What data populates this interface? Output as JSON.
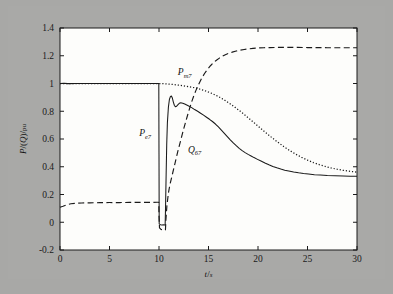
{
  "figure": {
    "background_color": "#a9a9a7",
    "plot_background_color": "#fdfdfb",
    "axis_color": "#1a1a1a"
  },
  "chart_data": {
    "type": "line",
    "title": "",
    "xlabel": "t/s",
    "ylabel": "P/(Q)/pu",
    "xlim": [
      0,
      30
    ],
    "ylim": [
      -0.2,
      1.4
    ],
    "xticks": [
      0,
      5,
      10,
      15,
      20,
      25,
      30
    ],
    "xtick_labels": [
      "0",
      "5",
      "10",
      "15",
      "20",
      "25",
      "30"
    ],
    "yticks": [
      -0.2,
      0,
      0.2,
      0.4,
      0.6,
      0.8,
      1,
      1.2,
      1.4
    ],
    "ytick_labels": [
      "-0.2",
      "0",
      "0.2",
      "0.4",
      "0.6",
      "0.8",
      "1",
      "1.2",
      "1.4"
    ],
    "grid": false,
    "legend_position": "inline-annotations",
    "annotations": [
      {
        "id": "Pe7",
        "text": "P",
        "sub": "e7",
        "x": 8.6,
        "y": 0.62
      },
      {
        "id": "Pm7",
        "text": "P",
        "sub": "m7",
        "x": 12.6,
        "y": 1.06
      },
      {
        "id": "Q67",
        "text": "Q",
        "sub": "67",
        "x": 13.6,
        "y": 0.5
      }
    ],
    "series": [
      {
        "name": "P_e7",
        "label": "Pe7",
        "style": "solid",
        "color": "#1a1a1a",
        "points": [
          [
            0.0,
            1.0
          ],
          [
            0.4,
            1.002
          ],
          [
            0.8,
            0.999
          ],
          [
            1.6,
            1.0
          ],
          [
            3.0,
            1.0
          ],
          [
            5.0,
            1.0
          ],
          [
            7.0,
            1.0
          ],
          [
            9.0,
            1.0
          ],
          [
            9.98,
            1.0
          ],
          [
            10.0,
            0.49
          ],
          [
            10.02,
            -0.012
          ],
          [
            10.15,
            -0.018
          ],
          [
            10.3,
            -0.02
          ],
          [
            10.45,
            -0.019
          ],
          [
            10.55,
            -0.02
          ],
          [
            10.62,
            -0.02
          ],
          [
            10.66,
            0.1
          ],
          [
            10.72,
            0.34
          ],
          [
            10.78,
            0.56
          ],
          [
            10.85,
            0.72
          ],
          [
            10.95,
            0.83
          ],
          [
            11.05,
            0.885
          ],
          [
            11.15,
            0.905
          ],
          [
            11.25,
            0.91
          ],
          [
            11.35,
            0.895
          ],
          [
            11.45,
            0.866
          ],
          [
            11.55,
            0.843
          ],
          [
            11.65,
            0.832
          ],
          [
            11.78,
            0.836
          ],
          [
            11.92,
            0.848
          ],
          [
            12.05,
            0.857
          ],
          [
            12.2,
            0.861
          ],
          [
            12.4,
            0.858
          ],
          [
            12.6,
            0.852
          ],
          [
            12.8,
            0.845
          ],
          [
            13.0,
            0.838
          ],
          [
            13.3,
            0.826
          ],
          [
            13.6,
            0.812
          ],
          [
            13.9,
            0.8
          ],
          [
            14.2,
            0.786
          ],
          [
            14.5,
            0.772
          ],
          [
            14.8,
            0.757
          ],
          [
            15.1,
            0.742
          ],
          [
            15.4,
            0.726
          ],
          [
            15.7,
            0.708
          ],
          [
            16.0,
            0.687
          ],
          [
            16.3,
            0.664
          ],
          [
            16.6,
            0.641
          ],
          [
            16.9,
            0.617
          ],
          [
            17.2,
            0.594
          ],
          [
            17.5,
            0.572
          ],
          [
            17.8,
            0.552
          ],
          [
            18.1,
            0.533
          ],
          [
            18.4,
            0.516
          ],
          [
            18.7,
            0.502
          ],
          [
            19.0,
            0.489
          ],
          [
            19.3,
            0.478
          ],
          [
            19.6,
            0.466
          ],
          [
            19.9,
            0.455
          ],
          [
            20.3,
            0.441
          ],
          [
            20.7,
            0.427
          ],
          [
            21.1,
            0.414
          ],
          [
            21.5,
            0.402
          ],
          [
            21.9,
            0.392
          ],
          [
            22.3,
            0.383
          ],
          [
            22.7,
            0.375
          ],
          [
            23.1,
            0.369
          ],
          [
            23.6,
            0.362
          ],
          [
            24.1,
            0.356
          ],
          [
            24.6,
            0.351
          ],
          [
            25.1,
            0.347
          ],
          [
            25.7,
            0.343
          ],
          [
            26.3,
            0.34
          ],
          [
            27.0,
            0.337
          ],
          [
            27.8,
            0.335
          ],
          [
            28.6,
            0.333
          ],
          [
            29.3,
            0.332
          ],
          [
            30.0,
            0.332
          ]
        ]
      },
      {
        "name": "P_m7",
        "label": "Pm7",
        "style": "dotted",
        "color": "#1a1a1a",
        "points": [
          [
            0.0,
            1.0
          ],
          [
            2.0,
            1.0
          ],
          [
            4.0,
            1.0
          ],
          [
            6.0,
            1.0
          ],
          [
            8.0,
            1.0
          ],
          [
            9.5,
            1.0
          ],
          [
            10.0,
            1.0
          ],
          [
            10.6,
            0.998
          ],
          [
            11.2,
            0.995
          ],
          [
            11.8,
            0.99
          ],
          [
            12.4,
            0.984
          ],
          [
            13.0,
            0.977
          ],
          [
            13.6,
            0.969
          ],
          [
            14.2,
            0.958
          ],
          [
            14.8,
            0.944
          ],
          [
            15.4,
            0.927
          ],
          [
            16.0,
            0.906
          ],
          [
            16.6,
            0.881
          ],
          [
            17.2,
            0.853
          ],
          [
            17.8,
            0.822
          ],
          [
            18.4,
            0.789
          ],
          [
            19.0,
            0.754
          ],
          [
            19.6,
            0.718
          ],
          [
            20.2,
            0.681
          ],
          [
            20.8,
            0.645
          ],
          [
            21.4,
            0.61
          ],
          [
            22.0,
            0.577
          ],
          [
            22.6,
            0.546
          ],
          [
            23.2,
            0.517
          ],
          [
            23.8,
            0.491
          ],
          [
            24.4,
            0.468
          ],
          [
            25.0,
            0.448
          ],
          [
            25.6,
            0.43
          ],
          [
            26.2,
            0.415
          ],
          [
            26.8,
            0.402
          ],
          [
            27.4,
            0.391
          ],
          [
            28.0,
            0.382
          ],
          [
            28.6,
            0.374
          ],
          [
            29.2,
            0.368
          ],
          [
            29.6,
            0.364
          ],
          [
            30.0,
            0.361
          ]
        ]
      },
      {
        "name": "Q_67",
        "label": "Q67",
        "style": "dashed",
        "color": "#1a1a1a",
        "points": [
          [
            0.0,
            0.108
          ],
          [
            0.3,
            0.115
          ],
          [
            0.7,
            0.126
          ],
          [
            1.1,
            0.133
          ],
          [
            1.6,
            0.137
          ],
          [
            2.2,
            0.139
          ],
          [
            3.0,
            0.14
          ],
          [
            4.0,
            0.141
          ],
          [
            5.0,
            0.142
          ],
          [
            6.0,
            0.142
          ],
          [
            7.0,
            0.143
          ],
          [
            8.0,
            0.143
          ],
          [
            9.0,
            0.143
          ],
          [
            9.8,
            0.144
          ],
          [
            9.98,
            0.144
          ],
          [
            10.0,
            0.05
          ],
          [
            10.05,
            -0.04
          ],
          [
            10.2,
            -0.052
          ],
          [
            10.4,
            -0.055
          ],
          [
            10.55,
            -0.056
          ],
          [
            10.65,
            -0.056
          ],
          [
            10.7,
            0.02
          ],
          [
            10.8,
            0.12
          ],
          [
            10.95,
            0.21
          ],
          [
            11.1,
            0.27
          ],
          [
            11.3,
            0.33
          ],
          [
            11.5,
            0.39
          ],
          [
            11.7,
            0.45
          ],
          [
            11.9,
            0.51
          ],
          [
            12.1,
            0.565
          ],
          [
            12.3,
            0.62
          ],
          [
            12.5,
            0.675
          ],
          [
            12.7,
            0.725
          ],
          [
            12.9,
            0.775
          ],
          [
            13.1,
            0.823
          ],
          [
            13.3,
            0.868
          ],
          [
            13.5,
            0.908
          ],
          [
            13.7,
            0.945
          ],
          [
            13.9,
            0.978
          ],
          [
            14.1,
            1.008
          ],
          [
            14.3,
            1.036
          ],
          [
            14.6,
            1.072
          ],
          [
            14.9,
            1.102
          ],
          [
            15.2,
            1.128
          ],
          [
            15.5,
            1.15
          ],
          [
            15.8,
            1.168
          ],
          [
            16.1,
            1.183
          ],
          [
            16.4,
            1.196
          ],
          [
            16.7,
            1.207
          ],
          [
            17.0,
            1.216
          ],
          [
            17.4,
            1.226
          ],
          [
            17.8,
            1.234
          ],
          [
            18.2,
            1.24
          ],
          [
            18.6,
            1.245
          ],
          [
            19.0,
            1.249
          ],
          [
            19.5,
            1.253
          ],
          [
            20.0,
            1.256
          ],
          [
            20.6,
            1.258
          ],
          [
            21.2,
            1.259
          ],
          [
            21.8,
            1.26
          ],
          [
            22.5,
            1.26
          ],
          [
            23.2,
            1.26
          ],
          [
            24.0,
            1.26
          ],
          [
            25.0,
            1.259
          ],
          [
            26.0,
            1.259
          ],
          [
            27.0,
            1.258
          ],
          [
            28.0,
            1.258
          ],
          [
            29.0,
            1.258
          ],
          [
            30.0,
            1.258
          ]
        ]
      }
    ]
  }
}
